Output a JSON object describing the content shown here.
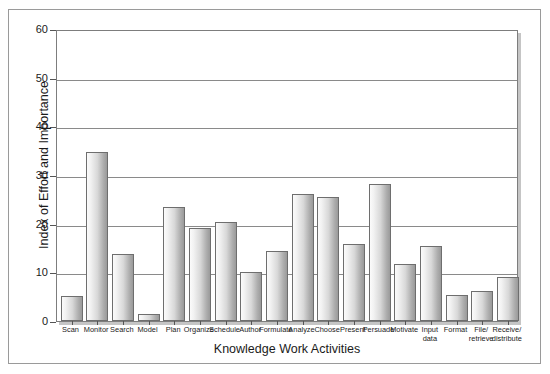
{
  "figure": {
    "background_color": "#ffffff",
    "frame_color": "#9a9a9a",
    "plot_border_color": "#7d7d7d",
    "gridline_color": "#8a8a8a",
    "bar_edge_color": "#6e6e6e",
    "bar_fill_light": "#fbfbfb",
    "bar_fill_dark": "#9a9a9a"
  },
  "chart_data": {
    "type": "bar",
    "title": "",
    "xlabel": "Knowledge Work Activities",
    "ylabel": "Index of Effort and Importance",
    "ylim": [
      0,
      60
    ],
    "yticks": [
      0,
      10,
      20,
      30,
      40,
      50,
      60
    ],
    "ytick_labels": [
      "0",
      "10",
      "20",
      "30",
      "40",
      "50",
      "60"
    ],
    "grid": true,
    "grid_axis": "y",
    "legend": false,
    "legend_position": "none",
    "categories": [
      "Scan",
      "Monitor",
      "Search",
      "Model",
      "Plan",
      "Organize",
      "Schedule",
      "Author",
      "Formulate",
      "Analyze",
      "Choose",
      "Present",
      "Persuade",
      "Motivate",
      "Input\ndata",
      "Format",
      "File/\nretrieve",
      "Receive/\ndistribute"
    ],
    "values": [
      5.2,
      34.8,
      13.7,
      1.5,
      23.4,
      19.2,
      20.3,
      10.0,
      14.4,
      26.0,
      25.4,
      15.8,
      28.2,
      11.7,
      15.4,
      5.3,
      6.2,
      9.1
    ]
  }
}
